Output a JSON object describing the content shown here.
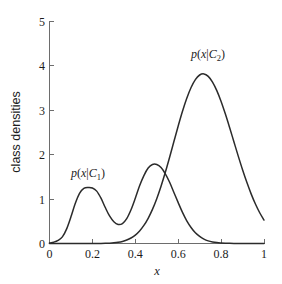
{
  "chart_data": {
    "type": "line",
    "title": "",
    "subtitle": "",
    "xlabel": "x",
    "ylabel": "class densities",
    "xlim": [
      0,
      1
    ],
    "ylim": [
      0,
      5
    ],
    "grid": false,
    "legend_position": "inline-annotations",
    "xticks": [
      "0",
      "0.2",
      "0.4",
      "0.6",
      "0.8",
      "1"
    ],
    "xtick_values": [
      0,
      0.2,
      0.4,
      0.6,
      0.8,
      1
    ],
    "yticks": [
      "0",
      "1",
      "2",
      "3",
      "4",
      "5"
    ],
    "ytick_values": [
      0,
      1,
      2,
      3,
      4,
      5
    ],
    "series": [
      {
        "name": "p(x|C_1)",
        "annotation": "p(x|C1)",
        "color": "#2b2b2b",
        "description": "bimodal class-conditional density for class C1",
        "peaks": [
          {
            "x": 0.2,
            "y": 1.25
          },
          {
            "x": 0.5,
            "y": 1.78
          }
        ],
        "valley": {
          "x": 0.33,
          "y": 0.42
        },
        "x": [
          0.0,
          0.02,
          0.04,
          0.06,
          0.08,
          0.1,
          0.12,
          0.14,
          0.16,
          0.18,
          0.2,
          0.22,
          0.24,
          0.26,
          0.28,
          0.3,
          0.32,
          0.34,
          0.36,
          0.38,
          0.4,
          0.42,
          0.44,
          0.46,
          0.48,
          0.5,
          0.52,
          0.54,
          0.56,
          0.58,
          0.6,
          0.62,
          0.64,
          0.66,
          0.68,
          0.7,
          0.72,
          0.74,
          0.76,
          0.78,
          0.8,
          0.82,
          0.84,
          0.86,
          0.88,
          0.9,
          0.92,
          0.94,
          0.96,
          0.98,
          1.0
        ],
        "values": [
          0.01,
          0.03,
          0.07,
          0.15,
          0.33,
          0.6,
          0.9,
          1.13,
          1.24,
          1.26,
          1.25,
          1.18,
          1.02,
          0.81,
          0.62,
          0.49,
          0.43,
          0.45,
          0.56,
          0.76,
          1.02,
          1.3,
          1.53,
          1.7,
          1.78,
          1.78,
          1.71,
          1.57,
          1.38,
          1.15,
          0.92,
          0.7,
          0.51,
          0.36,
          0.24,
          0.16,
          0.1,
          0.06,
          0.035,
          0.02,
          0.012,
          0.007,
          0.004,
          0.002,
          0.001,
          0.001,
          0.0,
          0.0,
          0.0,
          0.0,
          0.0
        ]
      },
      {
        "name": "p(x|C_2)",
        "annotation": "p(x|C2)",
        "color": "#2b2b2b",
        "description": "unimodal class-conditional density for class C2",
        "peaks": [
          {
            "x": 0.7,
            "y": 4.0
          }
        ],
        "x": [
          0.0,
          0.02,
          0.04,
          0.06,
          0.08,
          0.1,
          0.12,
          0.14,
          0.16,
          0.18,
          0.2,
          0.22,
          0.24,
          0.26,
          0.28,
          0.3,
          0.32,
          0.34,
          0.36,
          0.38,
          0.4,
          0.42,
          0.44,
          0.46,
          0.48,
          0.5,
          0.52,
          0.54,
          0.56,
          0.58,
          0.6,
          0.62,
          0.64,
          0.66,
          0.68,
          0.7,
          0.72,
          0.74,
          0.76,
          0.78,
          0.8,
          0.82,
          0.84,
          0.86,
          0.88,
          0.9,
          0.92,
          0.94,
          0.96,
          0.98,
          1.0
        ],
        "values": [
          0.0,
          0.0,
          0.0,
          0.0,
          0.0,
          0.0,
          0.0,
          0.0,
          0.0,
          0.0,
          0.0,
          0.001,
          0.002,
          0.004,
          0.008,
          0.015,
          0.027,
          0.047,
          0.078,
          0.124,
          0.19,
          0.283,
          0.407,
          0.568,
          0.768,
          1.009,
          1.29,
          1.604,
          1.944,
          2.296,
          2.646,
          2.977,
          3.271,
          3.514,
          3.692,
          3.795,
          3.819,
          3.764,
          3.636,
          3.444,
          3.199,
          2.915,
          2.606,
          2.286,
          1.968,
          1.662,
          1.377,
          1.118,
          0.89,
          0.693,
          0.528
        ]
      }
    ],
    "annotations": [
      {
        "text": "p(x|C1)",
        "x": 0.175,
        "y": 1.95,
        "series": "p(x|C_1)"
      },
      {
        "text": "p(x|C2)",
        "x": 0.665,
        "y": 4.63,
        "series": "p(x|C_2)"
      }
    ]
  },
  "labels": {
    "xaxis": "x",
    "yaxis": "class densities",
    "xtick_0": "0",
    "xtick_1": "0.2",
    "xtick_2": "0.4",
    "xtick_3": "0.6",
    "xtick_4": "0.8",
    "xtick_5": "1",
    "ytick_0": "0",
    "ytick_1": "1",
    "ytick_2": "2",
    "ytick_3": "3",
    "ytick_4": "4",
    "ytick_5": "5",
    "annotation_1_p": "p",
    "annotation_1_open": "(",
    "annotation_1_x": "x",
    "annotation_1_bar": "|",
    "annotation_1_C": "C",
    "annotation_1_sub": "1",
    "annotation_1_close": ")",
    "annotation_2_p": "p",
    "annotation_2_open": "(",
    "annotation_2_x": "x",
    "annotation_2_bar": "|",
    "annotation_2_C": "C",
    "annotation_2_sub": "2",
    "annotation_2_close": ")"
  },
  "colors": {
    "background": "#ffffff",
    "axis": "#6d6d6d",
    "curve": "#2b2b2b",
    "text": "#1c1c1c"
  }
}
